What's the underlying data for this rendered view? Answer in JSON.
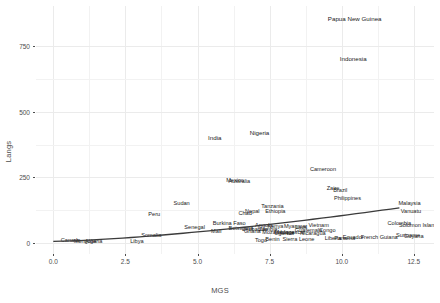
{
  "chart_data": {
    "type": "scatter",
    "title": "",
    "xlabel": "MGS",
    "ylabel": "Langs",
    "xlim": [
      -0.6,
      13.2
    ],
    "ylim": [
      -40,
      900
    ],
    "xticks": [
      "0.0",
      "2.5",
      "5.0",
      "7.5",
      "10.0",
      "12.5"
    ],
    "xtick_values": [
      0.0,
      2.5,
      5.0,
      7.5,
      10.0,
      12.5
    ],
    "yticks": [
      "0",
      "250",
      "500",
      "750"
    ],
    "ytick_values": [
      0,
      250,
      500,
      750
    ],
    "grid": true,
    "legend": "none",
    "marker_style": "text-label",
    "points": [
      {
        "label": "Papua New Guinea",
        "x": 10.45,
        "y": 850
      },
      {
        "label": "Indonesia",
        "x": 10.4,
        "y": 700
      },
      {
        "label": "Nigeria",
        "x": 7.15,
        "y": 420
      },
      {
        "label": "India",
        "x": 5.6,
        "y": 400
      },
      {
        "label": "Cameroon",
        "x": 9.35,
        "y": 280
      },
      {
        "label": "Mexico",
        "x": 6.3,
        "y": 235
      },
      {
        "label": "Australia",
        "x": 6.45,
        "y": 232
      },
      {
        "label": "Zaire",
        "x": 9.7,
        "y": 205
      },
      {
        "label": "Brazil",
        "x": 9.95,
        "y": 200
      },
      {
        "label": "Philippines",
        "x": 10.2,
        "y": 168
      },
      {
        "label": "Malaysia",
        "x": 12.35,
        "y": 150
      },
      {
        "label": "Sudan",
        "x": 4.45,
        "y": 148
      },
      {
        "label": "Tanzania",
        "x": 7.6,
        "y": 140
      },
      {
        "label": "Vanuatu",
        "x": 12.4,
        "y": 120
      },
      {
        "label": "Nepal",
        "x": 6.9,
        "y": 120
      },
      {
        "label": "Ethiopia",
        "x": 7.7,
        "y": 118
      },
      {
        "label": "Chad",
        "x": 6.65,
        "y": 110
      },
      {
        "label": "Peru",
        "x": 3.5,
        "y": 108
      },
      {
        "label": "Burkina Faso",
        "x": 6.1,
        "y": 75
      },
      {
        "label": "Colombia",
        "x": 12.0,
        "y": 72
      },
      {
        "label": "Solomon Islands",
        "x": 12.7,
        "y": 68
      },
      {
        "label": "Angola",
        "x": 7.3,
        "y": 66
      },
      {
        "label": "Vietnam",
        "x": 9.2,
        "y": 66
      },
      {
        "label": "Myanmar",
        "x": 8.4,
        "y": 64
      },
      {
        "label": "Kenya",
        "x": 7.7,
        "y": 62
      },
      {
        "label": "Laos",
        "x": 8.6,
        "y": 60
      },
      {
        "label": "Senegal",
        "x": 4.9,
        "y": 58
      },
      {
        "label": "Botswana",
        "x": 6.5,
        "y": 55
      },
      {
        "label": "Zambia",
        "x": 7.45,
        "y": 52
      },
      {
        "label": "Zimbabwe",
        "x": 7.0,
        "y": 50
      },
      {
        "label": "Guatemala",
        "x": 8.85,
        "y": 48
      },
      {
        "label": "Congo",
        "x": 9.5,
        "y": 46
      },
      {
        "label": "Ghana",
        "x": 6.9,
        "y": 44
      },
      {
        "label": "Mali",
        "x": 5.65,
        "y": 42
      },
      {
        "label": "Mozambique",
        "x": 7.8,
        "y": 40
      },
      {
        "label": "Madagascar",
        "x": 8.2,
        "y": 38
      },
      {
        "label": "Uganda",
        "x": 8.0,
        "y": 36
      },
      {
        "label": "Nicaragua",
        "x": 9.0,
        "y": 34
      },
      {
        "label": "Somalia",
        "x": 3.4,
        "y": 30
      },
      {
        "label": "Suriname",
        "x": 12.3,
        "y": 28
      },
      {
        "label": "Guyana",
        "x": 12.5,
        "y": 24
      },
      {
        "label": "French Guiana",
        "x": 11.3,
        "y": 22
      },
      {
        "label": "Ecuador",
        "x": 10.4,
        "y": 20
      },
      {
        "label": "Panama",
        "x": 10.1,
        "y": 18
      },
      {
        "label": "Liberia",
        "x": 9.7,
        "y": 16
      },
      {
        "label": "Sierra Leone",
        "x": 8.5,
        "y": 14
      },
      {
        "label": "Benin",
        "x": 7.6,
        "y": 12
      },
      {
        "label": "Togo",
        "x": 7.2,
        "y": 10
      },
      {
        "label": "Canada",
        "x": 0.6,
        "y": 8
      },
      {
        "label": "Mongolia",
        "x": 1.1,
        "y": 6
      },
      {
        "label": "Algeria",
        "x": 1.4,
        "y": 5
      },
      {
        "label": "Libya",
        "x": 2.9,
        "y": 4
      }
    ],
    "trend_line": {
      "type": "loess-fit",
      "color": "#3b3b3b",
      "x_start": 0.0,
      "y_start": 8,
      "x_end": 12.0,
      "y_end": 135
    }
  }
}
